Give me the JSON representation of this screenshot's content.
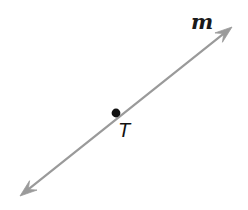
{
  "figure": {
    "kind": "geometry-line-diagram",
    "background_color": "#ffffff",
    "width": 248,
    "height": 210,
    "line": {
      "name": "line-m",
      "label": "m",
      "color": "#9a9a9a",
      "stroke_width": 2.2,
      "arrow_style": "double-headed",
      "start": {
        "x": 20,
        "y": 196
      },
      "end": {
        "x": 232,
        "y": 27
      },
      "arrowhead_color": "#9a9a9a",
      "arrowhead_length": 17,
      "arrowhead_half_width": 6
    },
    "points": [
      {
        "name": "point-t",
        "label": "T",
        "color": "#111111",
        "radius": 4.4,
        "x": 116,
        "y": 113,
        "label_x": 118,
        "label_y": 120
      }
    ],
    "labels": {
      "line_label": "m",
      "point_label": "T"
    }
  }
}
